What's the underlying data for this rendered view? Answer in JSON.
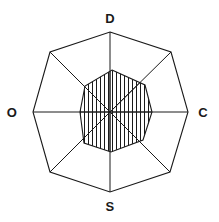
{
  "figure": {
    "background_color": "#ffffff",
    "line_color": "#1a1a1a",
    "hatch_color": "#1a1a1a",
    "label_color": "#1a1a1a",
    "center": {
      "x": 110,
      "y": 112
    },
    "outer_radius": 80,
    "sides": 8
  },
  "labels": {
    "top": "D",
    "right": "C",
    "bottom": "S",
    "left": "O"
  },
  "label_positions": {
    "top": {
      "x": 110,
      "y": 18
    },
    "right": {
      "x": 203,
      "y": 112
    },
    "bottom": {
      "x": 110,
      "y": 206
    },
    "left": {
      "x": 12,
      "y": 112
    }
  },
  "chart_data": {
    "type": "radar",
    "xlabel": "",
    "ylabel": "",
    "grid": false,
    "legend": "none",
    "axis_count": 8,
    "categories": [
      "D",
      "DC",
      "C",
      "CS",
      "S",
      "SO",
      "O",
      "OD"
    ],
    "labeled_categories": [
      "D",
      "C",
      "S",
      "O"
    ],
    "rmax": 1.0,
    "rlim": [
      0,
      1
    ],
    "outer_ring_values": [
      1.0,
      1.0,
      1.0,
      1.0,
      1.0,
      1.0,
      1.0,
      1.0
    ],
    "series": [
      {
        "name": "outer octagon",
        "fill": "none",
        "values": [
          1.0,
          1.0,
          1.0,
          1.0,
          1.0,
          1.0,
          1.0,
          1.0
        ]
      },
      {
        "name": "inner hatched region",
        "fill": "vertical-hatch",
        "values": [
          0.52,
          0.53,
          0.52,
          0.5,
          0.49,
          0.48,
          0.38,
          0.4
        ]
      }
    ],
    "outer_vertices_px": [
      {
        "label": "D",
        "x": 110,
        "y": 32
      },
      {
        "label": "DC",
        "x": 171,
        "y": 52
      },
      {
        "label": "C",
        "x": 188,
        "y": 112
      },
      {
        "label": "CS",
        "x": 170,
        "y": 172
      },
      {
        "label": "S",
        "x": 110,
        "y": 192
      },
      {
        "label": "SO",
        "x": 50,
        "y": 172
      },
      {
        "label": "O",
        "x": 33,
        "y": 112
      },
      {
        "label": "OD",
        "x": 50,
        "y": 52
      }
    ],
    "inner_vertices_px": [
      {
        "label": "D",
        "x": 112,
        "y": 70
      },
      {
        "label": "DC",
        "x": 145,
        "y": 85
      },
      {
        "label": "C",
        "x": 152,
        "y": 112
      },
      {
        "label": "CS",
        "x": 143,
        "y": 140
      },
      {
        "label": "S",
        "x": 111,
        "y": 152
      },
      {
        "label": "SO",
        "x": 84,
        "y": 143
      },
      {
        "label": "O",
        "x": 80,
        "y": 112
      },
      {
        "label": "OD",
        "x": 85,
        "y": 86
      }
    ],
    "spokes": [
      {
        "from": "center",
        "to": "D"
      },
      {
        "from": "center",
        "to": "DC"
      },
      {
        "from": "center",
        "to": "C"
      },
      {
        "from": "center",
        "to": "CS"
      },
      {
        "from": "center",
        "to": "S"
      },
      {
        "from": "center",
        "to": "SO"
      },
      {
        "from": "center",
        "to": "O"
      },
      {
        "from": "center",
        "to": "OD"
      }
    ],
    "hatch": {
      "orientation": "vertical",
      "spacing_px": 4,
      "stroke_width_px": 1
    }
  }
}
